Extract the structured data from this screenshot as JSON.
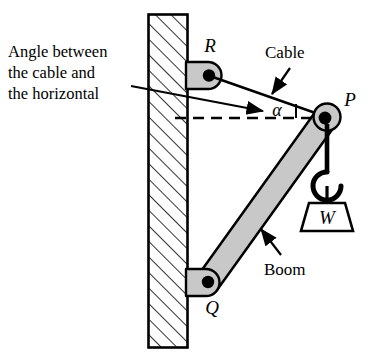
{
  "figure": {
    "background_color": "#ffffff",
    "line_color": "#000000",
    "member_fill": "#c8c8c8",
    "wall_hatch_color": "#000000"
  },
  "annotations": {
    "angle_note_line1": "Angle between",
    "angle_note_line2": "the cable and",
    "angle_note_line3": "the horizontal",
    "cable_label": "Cable",
    "boom_label": "Boom"
  },
  "points": {
    "r_label": "R",
    "p_label": "P",
    "q_label": "Q",
    "alpha_label": "α",
    "weight_label": "W"
  },
  "icons": {
    "cable_leader_arrow": "arrow-icon",
    "boom_leader_arrow": "arrow-icon",
    "angle_leader_arrow": "arrow-icon",
    "hook": "hook-icon",
    "pulley": "pulley-icon",
    "wall": "hatched-wall-icon",
    "weight_block": "weight-icon"
  }
}
